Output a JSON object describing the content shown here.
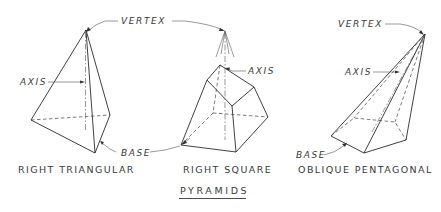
{
  "title": "PYRAMIDS",
  "labels": {
    "vertex_shared": "VERTEX",
    "vertex_oblique": "VERTEX",
    "axis_triangular": "AXIS",
    "axis_square": "AXIS",
    "axis_oblique": "AXIS",
    "base_shared": "BASE",
    "base_oblique": "BASE"
  },
  "figures": [
    {
      "id": "right-triangular",
      "caption": "RIGHT TRIANGULAR"
    },
    {
      "id": "right-square",
      "caption": "RIGHT SQUARE"
    },
    {
      "id": "oblique-pentagonal",
      "caption": "OBLIQUE PENTAGONAL"
    }
  ],
  "colors": {
    "line": "#2b2b2b",
    "text": "#3a3a3a",
    "background": "#ffffff"
  }
}
